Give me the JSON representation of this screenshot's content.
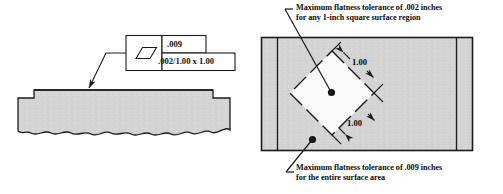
{
  "figure": {
    "background_color": "#ffffff",
    "line_color": "#1a1a1a",
    "fill_color": "#d4d4d4"
  },
  "left_view": {
    "name": "stepped part side view",
    "feature_control_frame": {
      "symbol": "flatness-parallelogram",
      "upper_value": ".009",
      "lower_value": ".002/1.00 x 1.00"
    },
    "leader": {
      "points_to": "top surface of part"
    }
  },
  "right_view": {
    "name": "surface plan view with unit square",
    "unit_square": {
      "label": "rotated 1.00 x 1.00 square region"
    },
    "dimensions": [
      {
        "label": "1.00",
        "position": "upper-right side of unit square"
      },
      {
        "label": "1.00",
        "position": "lower-right side of unit square"
      }
    ],
    "annotations": [
      {
        "id": "unit-area-note",
        "line1": "Maximum flatness tolerance of .002 inches",
        "line2": "for any 1-inch square surface region"
      },
      {
        "id": "whole-surface-note",
        "line1": "Maximum flatness tolerance of .009 inches",
        "line2": "for the entire surface area"
      }
    ]
  }
}
